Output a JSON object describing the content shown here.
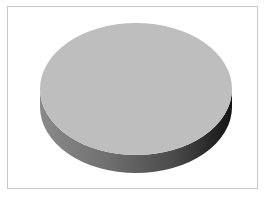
{
  "chart_data": {
    "type": "pie",
    "style": "3d",
    "title": "",
    "categories": [
      ""
    ],
    "values": [
      100
    ],
    "series": [
      {
        "name": "",
        "values": [
          100
        ]
      }
    ],
    "colors": {
      "top_face": "#bebebe",
      "side_light": "#7a7a7a",
      "side_dark": "#1c1c1c",
      "frame_border": "#c8c8c8",
      "background": "#ffffff"
    },
    "legend": {
      "visible": false
    },
    "labels": {
      "visible": false
    },
    "geometry": {
      "cx": 136,
      "cy": 89,
      "rx": 96,
      "ry": 66,
      "depth": 18
    }
  }
}
